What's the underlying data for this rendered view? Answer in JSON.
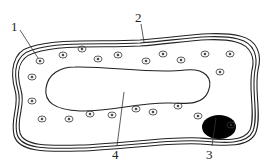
{
  "diagram": {
    "title": "",
    "type": "cell structure diagram",
    "labels": [
      {
        "id": "1",
        "text": "1",
        "x": 11,
        "y": 20,
        "target": "granule"
      },
      {
        "id": "2",
        "text": "2",
        "x": 135,
        "y": 11,
        "target": "cell-wall"
      },
      {
        "id": "3",
        "text": "3",
        "x": 206,
        "y": 148,
        "target": "nucleus"
      },
      {
        "id": "4",
        "text": "4",
        "x": 112,
        "y": 148,
        "target": "vacuole"
      }
    ],
    "colors": {
      "line": "#222222",
      "nucleus": "#000000",
      "background": "#ffffff"
    }
  }
}
